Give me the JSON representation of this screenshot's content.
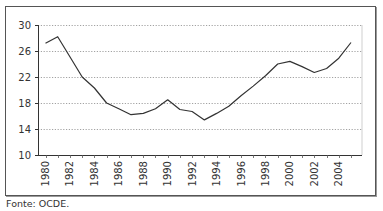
{
  "chart_data": {
    "type": "line",
    "title": "",
    "xlabel": "",
    "ylabel": "",
    "ylim": [
      10,
      30
    ],
    "xlim": [
      1980,
      2005
    ],
    "grid": true,
    "legend": null,
    "y_ticks": [
      "30",
      "26",
      "22",
      "18",
      "14",
      "10"
    ],
    "x_tick_labels": [
      "1980",
      "1982",
      "1984",
      "1986",
      "1988",
      "1990",
      "1992",
      "1994",
      "1996",
      "1998",
      "2000",
      "2002",
      "2004"
    ],
    "x": [
      1980,
      1981,
      1982,
      1983,
      1984,
      1985,
      1986,
      1987,
      1988,
      1989,
      1990,
      1991,
      1992,
      1993,
      1994,
      1995,
      1996,
      1997,
      1998,
      1999,
      2000,
      2001,
      2002,
      2003,
      2004,
      2005
    ],
    "series": [
      {
        "name": "",
        "color": "#333333",
        "values": [
          27.2,
          28.2,
          25.1,
          22.0,
          20.3,
          18.0,
          17.1,
          16.2,
          16.4,
          17.1,
          18.5,
          17.0,
          16.7,
          15.4,
          16.4,
          17.5,
          19.1,
          20.6,
          22.2,
          24.0,
          24.4,
          23.6,
          22.7,
          23.3,
          24.9,
          27.3
        ]
      }
    ]
  },
  "source_note": "Fonte: OCDE."
}
